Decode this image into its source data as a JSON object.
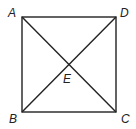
{
  "diagram": {
    "type": "geometry",
    "shape": "square with diagonals",
    "stroke_color": "#222222",
    "points": [
      {
        "label": "A",
        "x": 22,
        "y": 17
      },
      {
        "label": "D",
        "x": 116,
        "y": 17
      },
      {
        "label": "B",
        "x": 22,
        "y": 112
      },
      {
        "label": "C",
        "x": 116,
        "y": 112
      },
      {
        "label": "E",
        "x": 69,
        "y": 65
      }
    ],
    "segments": [
      "AD",
      "DC",
      "CB",
      "BA",
      "AC",
      "BD"
    ],
    "labels": {
      "A": "A",
      "B": "B",
      "C": "C",
      "D": "D",
      "E": "E"
    }
  }
}
